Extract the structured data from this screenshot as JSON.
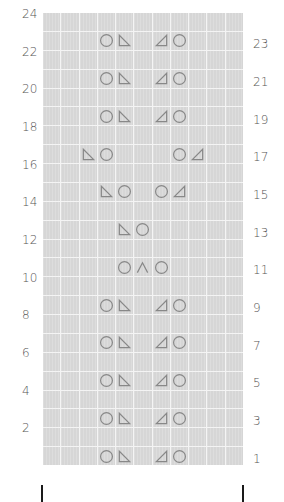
{
  "chart": {
    "columns": 11,
    "rows": 24,
    "cell_color": "#d6d6d6",
    "symbol_color": "#888888",
    "left_labels": [
      "24",
      "22",
      "20",
      "18",
      "16",
      "14",
      "12",
      "10",
      "8",
      "6",
      "4",
      "2"
    ],
    "right_labels": [
      "23",
      "21",
      "19",
      "17",
      "15",
      "13",
      "11",
      "9",
      "7",
      "5",
      "3",
      "1"
    ],
    "symbols": {
      "yo": "circle (yarn over)",
      "ssk": "left-slant triangle",
      "k2tog": "right-slant triangle",
      "s2kp": "caret (centered double decrease)"
    },
    "pattern_rows": {
      "1": [
        [
          3,
          "yo"
        ],
        [
          4,
          "ssk"
        ],
        [
          6,
          "k2tog"
        ],
        [
          7,
          "yo"
        ]
      ],
      "3": [
        [
          3,
          "yo"
        ],
        [
          4,
          "ssk"
        ],
        [
          6,
          "k2tog"
        ],
        [
          7,
          "yo"
        ]
      ],
      "5": [
        [
          3,
          "yo"
        ],
        [
          4,
          "ssk"
        ],
        [
          6,
          "k2tog"
        ],
        [
          7,
          "yo"
        ]
      ],
      "7": [
        [
          3,
          "yo"
        ],
        [
          4,
          "ssk"
        ],
        [
          6,
          "k2tog"
        ],
        [
          7,
          "yo"
        ]
      ],
      "9": [
        [
          3,
          "yo"
        ],
        [
          4,
          "ssk"
        ],
        [
          6,
          "k2tog"
        ],
        [
          7,
          "yo"
        ]
      ],
      "11": [
        [
          4,
          "yo"
        ],
        [
          5,
          "s2kp"
        ],
        [
          6,
          "yo"
        ]
      ],
      "13": [
        [
          4,
          "ssk"
        ],
        [
          5,
          "yo"
        ]
      ],
      "15": [
        [
          3,
          "ssk"
        ],
        [
          4,
          "yo"
        ],
        [
          6,
          "yo"
        ],
        [
          7,
          "k2tog"
        ]
      ],
      "17": [
        [
          2,
          "ssk"
        ],
        [
          3,
          "yo"
        ],
        [
          7,
          "yo"
        ],
        [
          8,
          "k2tog"
        ]
      ],
      "19": [
        [
          3,
          "yo"
        ],
        [
          4,
          "ssk"
        ],
        [
          6,
          "k2tog"
        ],
        [
          7,
          "yo"
        ]
      ],
      "21": [
        [
          3,
          "yo"
        ],
        [
          4,
          "ssk"
        ],
        [
          6,
          "k2tog"
        ],
        [
          7,
          "yo"
        ]
      ],
      "23": [
        [
          3,
          "yo"
        ],
        [
          4,
          "ssk"
        ],
        [
          6,
          "k2tog"
        ],
        [
          7,
          "yo"
        ]
      ]
    },
    "repeat_markers": [
      "left-repeat-bar",
      "right-repeat-bar"
    ]
  }
}
